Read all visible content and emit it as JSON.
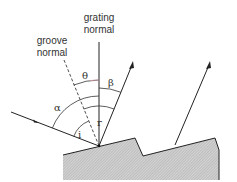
{
  "diagram": {
    "labels": {
      "grating_normal_line1": "grating",
      "grating_normal_line2": "normal",
      "groove_normal_line1": "groove",
      "groove_normal_line2": "normal",
      "theta": "θ",
      "beta": "β",
      "alpha": "α",
      "r": "r",
      "i": "i"
    },
    "colors": {
      "line": "#222222",
      "text": "#333333",
      "theta_arc_accent": "#d9a0a8",
      "grating_fill": "#c8c8c8"
    },
    "elements": [
      "grating normal (vertical solid line)",
      "groove normal (dashed line)",
      "incident ray with arrow",
      "diffracted ray with arrowhead",
      "second diffracted ray from adjacent groove",
      "blazed grating sawtooth profile (hatched)",
      "angle arcs: theta, beta, alpha, r, i"
    ]
  }
}
